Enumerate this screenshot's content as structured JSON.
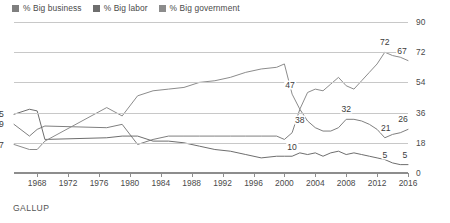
{
  "legend": {
    "position": "top-left",
    "items": [
      {
        "label": "% Big business",
        "color": "#7f7f7f",
        "icon": "square-swatch-icon"
      },
      {
        "label": "% Big labor",
        "color": "#6e6e6e",
        "icon": "square-swatch-icon"
      },
      {
        "label": "% Big government",
        "color": "#8c8c8c",
        "icon": "square-swatch-icon"
      }
    ]
  },
  "footer": {
    "source": "GALLUP"
  },
  "axes": {
    "y_ticks": [
      "0",
      "18",
      "36",
      "54",
      "72",
      "90"
    ],
    "x_ticks": [
      "1968",
      "1972",
      "1976",
      "1980",
      "1984",
      "1988",
      "1992",
      "1996",
      "2000",
      "2004",
      "2008",
      "2012",
      "2016"
    ]
  },
  "annotations": [
    {
      "name": "label-big-labor-start",
      "text": "35",
      "x": 1965,
      "y": 35,
      "dx": -15,
      "dy": 0
    },
    {
      "name": "label-big-business-start",
      "text": "29",
      "x": 1965,
      "y": 29,
      "dx": -15,
      "dy": 0
    },
    {
      "name": "label-big-government-start",
      "text": "17",
      "x": 1965,
      "y": 17,
      "dx": -15,
      "dy": 0
    },
    {
      "name": "label-big-government-2001",
      "text": "47",
      "x": 2001,
      "y": 47,
      "dx": -2,
      "dy": -9
    },
    {
      "name": "label-big-government-2002",
      "text": "38",
      "x": 2002,
      "y": 38,
      "dx": 0,
      "dy": 11
    },
    {
      "name": "label-big-government-2013",
      "text": "72",
      "x": 2013,
      "y": 72,
      "dx": 0,
      "dy": -10
    },
    {
      "name": "label-big-government-2016",
      "text": "67",
      "x": 2016,
      "y": 67,
      "dx": -6,
      "dy": -10
    },
    {
      "name": "label-big-business-2008",
      "text": "32",
      "x": 2008,
      "y": 32,
      "dx": 0,
      "dy": -10
    },
    {
      "name": "label-big-business-2013",
      "text": "21",
      "x": 2013,
      "y": 21,
      "dx": 1,
      "dy": -10
    },
    {
      "name": "label-big-business-2016",
      "text": "26",
      "x": 2016,
      "y": 26,
      "dx": -5,
      "dy": -10
    },
    {
      "name": "label-big-labor-2001",
      "text": "10",
      "x": 2001,
      "y": 10,
      "dx": 0,
      "dy": -9
    },
    {
      "name": "label-big-labor-2013",
      "text": "5",
      "x": 2013,
      "y": 5,
      "dx": 0,
      "dy": -10
    },
    {
      "name": "label-big-labor-2016",
      "text": "5",
      "x": 2016,
      "y": 5,
      "dx": -3,
      "dy": -10
    }
  ],
  "chart_data": {
    "type": "line",
    "title": "",
    "xlabel": "",
    "ylabel": "",
    "xlim": [
      1965,
      2016
    ],
    "ylim": [
      0,
      90
    ],
    "grid": "horizontal",
    "legend_position": "top-left",
    "series": [
      {
        "name": "% Big business",
        "color": "#7f7f7f",
        "x": [
          1965,
          1967,
          1968,
          1969,
          1977,
          1979,
          1981,
          1983,
          1985,
          1987,
          1989,
          1991,
          1993,
          1995,
          1997,
          1999,
          2000,
          2001,
          2002,
          2003,
          2004,
          2005,
          2006,
          2007,
          2008,
          2009,
          2010,
          2011,
          2012,
          2013,
          2014,
          2015,
          2016
        ],
        "values": [
          29,
          22,
          26,
          28,
          27,
          29,
          17,
          20,
          22,
          22,
          22,
          22,
          22,
          22,
          22,
          22,
          20,
          24,
          38,
          31,
          27,
          25,
          25,
          27,
          32,
          32,
          31,
          29,
          26,
          21,
          23,
          24,
          26
        ]
      },
      {
        "name": "% Big labor",
        "color": "#6e6e6e",
        "x": [
          1965,
          1967,
          1968,
          1969,
          1977,
          1979,
          1981,
          1983,
          1985,
          1987,
          1989,
          1991,
          1993,
          1995,
          1997,
          1999,
          2000,
          2001,
          2002,
          2003,
          2004,
          2005,
          2006,
          2007,
          2008,
          2009,
          2010,
          2011,
          2012,
          2013,
          2014,
          2015,
          2016
        ],
        "values": [
          35,
          38,
          37,
          20,
          21,
          22,
          22,
          19,
          19,
          18,
          16,
          14,
          13,
          11,
          9,
          10,
          10,
          10,
          12,
          11,
          12,
          10,
          12,
          13,
          11,
          12,
          11,
          10,
          9,
          8,
          6,
          5,
          5
        ]
      },
      {
        "name": "% Big government",
        "color": "#8c8c8c",
        "x": [
          1965,
          1967,
          1968,
          1969,
          1977,
          1979,
          1981,
          1983,
          1985,
          1987,
          1989,
          1991,
          1993,
          1995,
          1997,
          1999,
          2000,
          2001,
          2002,
          2003,
          2004,
          2005,
          2006,
          2007,
          2008,
          2009,
          2010,
          2011,
          2012,
          2013,
          2014,
          2015,
          2016
        ],
        "values": [
          17,
          14,
          14,
          19,
          39,
          34,
          46,
          49,
          50,
          51,
          54,
          55,
          57,
          60,
          62,
          63,
          65,
          47,
          38,
          48,
          50,
          49,
          53,
          57,
          52,
          50,
          55,
          60,
          65,
          72,
          70,
          69,
          67
        ]
      }
    ]
  }
}
